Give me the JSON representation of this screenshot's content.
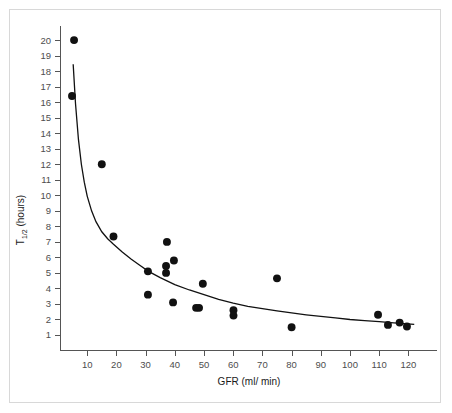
{
  "figure": {
    "border_color": "#d8d8d8",
    "background": "#ffffff",
    "point_color": "#111111",
    "axis_color": "#555555",
    "curve_color": "#111111"
  },
  "chart_data": {
    "type": "scatter",
    "title": "",
    "xlabel": "GFR (ml/ min)",
    "ylabel_main": "T",
    "ylabel_sub": "1/2",
    "ylabel_unit": " (hours)",
    "ylabel": "T1/2 (hours)",
    "xlim": [
      0,
      125
    ],
    "ylim": [
      0,
      20.8
    ],
    "grid": false,
    "legend": null,
    "xticks": [
      10,
      20,
      30,
      40,
      50,
      60,
      70,
      80,
      90,
      100,
      110,
      120
    ],
    "xtick_labels": [
      "10",
      "20",
      "30",
      "40",
      "50",
      "60",
      "70",
      "80",
      "90",
      "100",
      "110",
      "120"
    ],
    "yticks": [
      1,
      2,
      3,
      4,
      5,
      6,
      7,
      8,
      9,
      10,
      11,
      12,
      13,
      14,
      15,
      16,
      17,
      18,
      19,
      20
    ],
    "ytick_labels": [
      "1",
      "2",
      "3",
      "4",
      "5",
      "6",
      "7",
      "8",
      "9",
      "10",
      "11",
      "12",
      "13",
      "14",
      "15",
      "16",
      "17",
      "18",
      "19",
      "20"
    ],
    "series": [
      {
        "name": "patients",
        "marker": "filled-circle",
        "marker_size": 5.5,
        "points": [
          {
            "x": 5.5,
            "y": 20.0
          },
          {
            "x": 4.8,
            "y": 16.4
          },
          {
            "x": 15.0,
            "y": 12.0
          },
          {
            "x": 19.0,
            "y": 7.35
          },
          {
            "x": 30.8,
            "y": 5.1
          },
          {
            "x": 30.8,
            "y": 3.6
          },
          {
            "x": 37.3,
            "y": 7.0
          },
          {
            "x": 37.0,
            "y": 5.45
          },
          {
            "x": 37.0,
            "y": 5.0
          },
          {
            "x": 39.7,
            "y": 5.8
          },
          {
            "x": 39.4,
            "y": 3.1
          },
          {
            "x": 47.3,
            "y": 2.75
          },
          {
            "x": 48.3,
            "y": 2.75
          },
          {
            "x": 49.6,
            "y": 4.3
          },
          {
            "x": 60.1,
            "y": 2.6
          },
          {
            "x": 60.1,
            "y": 2.25
          },
          {
            "x": 75.0,
            "y": 4.65
          },
          {
            "x": 80.0,
            "y": 1.5
          },
          {
            "x": 109.6,
            "y": 2.3
          },
          {
            "x": 113.0,
            "y": 1.65
          },
          {
            "x": 117.0,
            "y": 1.8
          },
          {
            "x": 119.5,
            "y": 1.55
          }
        ]
      }
    ],
    "fit_curve": {
      "name": "inverse-fit",
      "description": "monotonic decreasing fitted curve",
      "x_start": 5.2,
      "x_end": 122.0,
      "y_start": 18.45,
      "y_end": 1.68,
      "points": [
        {
          "x": 5.2,
          "y": 18.45
        },
        {
          "x": 6.0,
          "y": 15.9
        },
        {
          "x": 7.0,
          "y": 13.6
        },
        {
          "x": 8.0,
          "y": 12.0
        },
        {
          "x": 9.0,
          "y": 10.85
        },
        {
          "x": 10.0,
          "y": 9.95
        },
        {
          "x": 11.5,
          "y": 9.0
        },
        {
          "x": 13.0,
          "y": 8.3
        },
        {
          "x": 15.0,
          "y": 7.65
        },
        {
          "x": 17.0,
          "y": 7.2
        },
        {
          "x": 19.0,
          "y": 6.85
        },
        {
          "x": 22.0,
          "y": 6.35
        },
        {
          "x": 25.0,
          "y": 5.9
        },
        {
          "x": 28.0,
          "y": 5.5
        },
        {
          "x": 31.0,
          "y": 5.1
        },
        {
          "x": 35.0,
          "y": 4.7
        },
        {
          "x": 40.0,
          "y": 4.25
        },
        {
          "x": 45.0,
          "y": 3.9
        },
        {
          "x": 50.0,
          "y": 3.6
        },
        {
          "x": 55.0,
          "y": 3.3
        },
        {
          "x": 60.0,
          "y": 3.05
        },
        {
          "x": 65.0,
          "y": 2.85
        },
        {
          "x": 70.0,
          "y": 2.7
        },
        {
          "x": 75.0,
          "y": 2.55
        },
        {
          "x": 80.0,
          "y": 2.42
        },
        {
          "x": 85.0,
          "y": 2.3
        },
        {
          "x": 90.0,
          "y": 2.2
        },
        {
          "x": 95.0,
          "y": 2.1
        },
        {
          "x": 100.0,
          "y": 2.0
        },
        {
          "x": 105.0,
          "y": 1.93
        },
        {
          "x": 110.0,
          "y": 1.86
        },
        {
          "x": 115.0,
          "y": 1.78
        },
        {
          "x": 122.0,
          "y": 1.68
        }
      ]
    }
  }
}
